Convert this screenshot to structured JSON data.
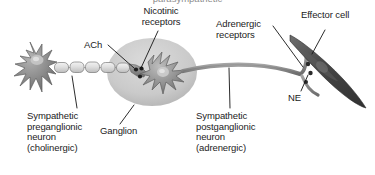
{
  "figure": {
    "title_cropped": "parasympathetic",
    "background_color": "#ffffff",
    "text_color": "#1b1b1b",
    "width": 375,
    "height": 175
  },
  "labels": {
    "nicotinic_receptors": "Nicotinic\nreceptors",
    "ach": "ACh",
    "adrenergic_receptors": "Adrenergic\nreceptors",
    "effector_cell": "Effector cell",
    "ne": "NE",
    "ganglion": "Ganglion",
    "preganglionic": "Sympathetic\npreganglionic\nneuron\n(cholinergic)",
    "postganglionic": "Sympathetic\npostganglionic\nneuron\n(adrenergic)"
  },
  "structures": {
    "preganglionic_soma": "preganglionic-cell-body",
    "myelin_sheath": "myelin-sheath-segments",
    "ganglion_circle": "ganglion-capsule",
    "postganglionic_soma": "postganglionic-cell-body",
    "postganglionic_axon": "postganglionic-axon",
    "varicosities": "axon-varicosities",
    "effector_cell_body": "effector-cell",
    "synaptic_vesicles": "neurotransmitter-vesicles"
  },
  "colors": {
    "neuron_fill": "#8b8b8b",
    "neuron_dark": "#6a6a6a",
    "ganglion_fill": "#cfcfcf",
    "myelin_fill": "#e2e2e2",
    "effector_fill": "#4a4a4a",
    "leader_line": "#1b1b1b",
    "vesicle": "#2a2a2a"
  }
}
